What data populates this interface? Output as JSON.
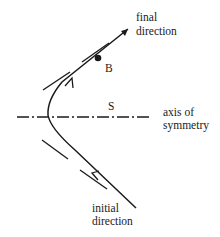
{
  "diagram": {
    "labels": {
      "final_direction_line1": "final",
      "final_direction_line2": "direction",
      "point_b": "B",
      "point_s": "S",
      "axis_line1": "axis of",
      "axis_line2": "symmetry",
      "initial_direction_line1": "initial",
      "initial_direction_line2": "direction"
    },
    "colors": {
      "stroke": "#1a1a1a",
      "background": "#ffffff"
    }
  }
}
